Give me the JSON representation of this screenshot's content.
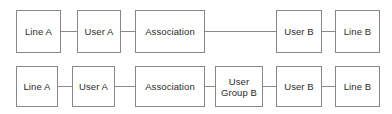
{
  "diagram": {
    "type": "node-link-diagram",
    "background_color": "#ffffff",
    "node_fill_color": "#ffffff",
    "node_border_color": "#878787",
    "connector_color": "#8a8a8a",
    "text_color": "#2b2b2b",
    "rows": [
      {
        "id": "row-1",
        "name": "direct-association-row",
        "nodes": [
          {
            "id": "r1-line-a",
            "label": "Line A",
            "x": 16,
            "y": 10,
            "w": 45,
            "h": 43
          },
          {
            "id": "r1-user-a",
            "label": "User A",
            "x": 77,
            "y": 10,
            "w": 44,
            "h": 43
          },
          {
            "id": "r1-association",
            "label": "Association",
            "x": 135,
            "y": 10,
            "w": 70,
            "h": 43
          },
          {
            "id": "r1-user-b",
            "label": "User B",
            "x": 276,
            "y": 10,
            "w": 46,
            "h": 43
          },
          {
            "id": "r1-line-b",
            "label": "Line B",
            "x": 335,
            "y": 10,
            "w": 45,
            "h": 43
          }
        ],
        "connectors": [
          {
            "id": "r1-c1",
            "from": "r1-line-a",
            "to": "r1-user-a",
            "x": 61,
            "y": 31,
            "w": 16
          },
          {
            "id": "r1-c2",
            "from": "r1-user-a",
            "to": "r1-association",
            "x": 121,
            "y": 31,
            "w": 14
          },
          {
            "id": "r1-c3",
            "from": "r1-association",
            "to": "r1-user-b",
            "x": 205,
            "y": 31,
            "w": 71
          },
          {
            "id": "r1-c4",
            "from": "r1-user-b",
            "to": "r1-line-b",
            "x": 322,
            "y": 31,
            "w": 13
          }
        ]
      },
      {
        "id": "row-2",
        "name": "group-mediated-association-row",
        "nodes": [
          {
            "id": "r2-line-a",
            "label": "Line A",
            "x": 16,
            "y": 66,
            "w": 42,
            "h": 41
          },
          {
            "id": "r2-user-a",
            "label": "User A",
            "x": 72,
            "y": 66,
            "w": 43,
            "h": 41
          },
          {
            "id": "r2-association",
            "label": "Association",
            "x": 135,
            "y": 66,
            "w": 70,
            "h": 41
          },
          {
            "id": "r2-user-group-b",
            "label": "User\nGroup B",
            "x": 215,
            "y": 66,
            "w": 48,
            "h": 41
          },
          {
            "id": "r2-user-b",
            "label": "User B",
            "x": 276,
            "y": 66,
            "w": 46,
            "h": 41
          },
          {
            "id": "r2-line-b",
            "label": "Line B",
            "x": 335,
            "y": 66,
            "w": 45,
            "h": 41
          }
        ],
        "connectors": [
          {
            "id": "r2-c1",
            "from": "r2-line-a",
            "to": "r2-user-a",
            "x": 58,
            "y": 86,
            "w": 14
          },
          {
            "id": "r2-c2",
            "from": "r2-user-a",
            "to": "r2-association",
            "x": 115,
            "y": 86,
            "w": 20
          },
          {
            "id": "r2-c3",
            "from": "r2-association",
            "to": "r2-user-group-b",
            "x": 205,
            "y": 86,
            "w": 10
          },
          {
            "id": "r2-c4",
            "from": "r2-user-group-b",
            "to": "r2-user-b",
            "x": 263,
            "y": 86,
            "w": 13
          },
          {
            "id": "r2-c5",
            "from": "r2-user-b",
            "to": "r2-line-b",
            "x": 322,
            "y": 86,
            "w": 13
          }
        ]
      }
    ]
  }
}
